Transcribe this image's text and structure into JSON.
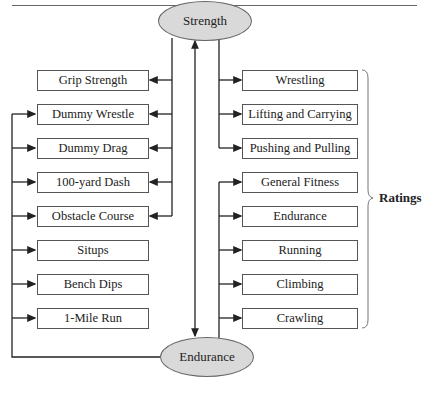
{
  "diagram": {
    "nodes": {
      "strength": "Strength",
      "endurance": "Endurance"
    },
    "left_tests": [
      {
        "label": "Grip Strength",
        "from": [
          "strength"
        ]
      },
      {
        "label": "Dummy Wrestle",
        "from": [
          "strength",
          "endurance"
        ]
      },
      {
        "label": "Dummy Drag",
        "from": [
          "strength",
          "endurance"
        ]
      },
      {
        "label": "100-yard Dash",
        "from": [
          "strength",
          "endurance"
        ]
      },
      {
        "label": "Obstacle Course",
        "from": [
          "strength",
          "endurance"
        ]
      },
      {
        "label": "Situps",
        "from": [
          "endurance"
        ]
      },
      {
        "label": "Bench Dips",
        "from": [
          "endurance"
        ]
      },
      {
        "label": "1-Mile Run",
        "from": [
          "endurance"
        ]
      }
    ],
    "right_ratings": [
      {
        "label": "Wrestling",
        "from": [
          "strength"
        ]
      },
      {
        "label": "Lifting and Carrying",
        "from": [
          "strength"
        ]
      },
      {
        "label": "Pushing and Pulling",
        "from": [
          "strength"
        ]
      },
      {
        "label": "General Fitness",
        "from": [
          "endurance"
        ]
      },
      {
        "label": "Endurance",
        "from": [
          "endurance"
        ]
      },
      {
        "label": "Running",
        "from": [
          "endurance"
        ]
      },
      {
        "label": "Climbing",
        "from": [
          "endurance"
        ]
      },
      {
        "label": "Crawling",
        "from": [
          "endurance"
        ]
      }
    ],
    "brace_label": "Ratings",
    "link": "Strength <-> Endurance (bidirectional)"
  },
  "colors": {
    "ellipse_fill": "#d9d9d9",
    "line": "#222222",
    "box_border": "#555555"
  }
}
